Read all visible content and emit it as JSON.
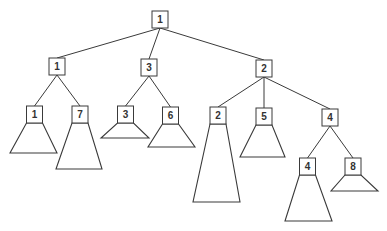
{
  "diagram": {
    "type": "tree",
    "root": {
      "id": "n0",
      "label": "1",
      "children": [
        {
          "id": "n1",
          "label": "1",
          "children": [
            {
              "id": "n11",
              "label": "1",
              "subtree": true
            },
            {
              "id": "n12",
              "label": "7",
              "subtree": true
            }
          ]
        },
        {
          "id": "n2",
          "label": "3",
          "children": [
            {
              "id": "n21",
              "label": "3",
              "subtree": true
            },
            {
              "id": "n22",
              "label": "6",
              "subtree": true
            }
          ]
        },
        {
          "id": "n3",
          "label": "2",
          "children": [
            {
              "id": "n31",
              "label": "2",
              "subtree": true
            },
            {
              "id": "n32",
              "label": "5",
              "subtree": true
            },
            {
              "id": "n33",
              "label": "4",
              "children": [
                {
                  "id": "n331",
                  "label": "4",
                  "subtree": true
                },
                {
                  "id": "n332",
                  "label": "8",
                  "subtree": true
                }
              ]
            }
          ]
        }
      ]
    }
  }
}
